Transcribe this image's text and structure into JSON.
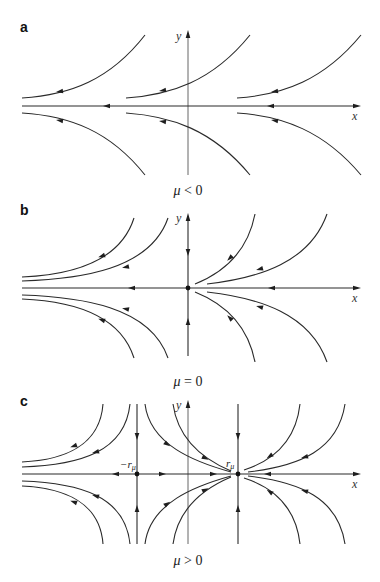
{
  "figure": {
    "panels": [
      {
        "id": "a",
        "label": "a",
        "caption_mu": "μ",
        "caption_rest": " < 0",
        "x_axis_label": "x",
        "y_axis_label": "y",
        "description": "No fixed points; all trajectories flow leftward"
      },
      {
        "id": "b",
        "label": "b",
        "caption_mu": "μ",
        "caption_rest": " = 0",
        "x_axis_label": "x",
        "y_axis_label": "y",
        "description": "Single half-stable fixed point at origin"
      },
      {
        "id": "c",
        "label": "c",
        "caption_mu": "μ",
        "caption_rest": " > 0",
        "x_axis_label": "x",
        "y_axis_label": "y",
        "neg_point_label": "−r",
        "neg_point_sub": "μ",
        "pos_point_label": "r",
        "pos_point_sub": "μ",
        "description": "Saddle at −rμ and stable node at rμ"
      }
    ],
    "colors": {
      "stroke": "#2a2a2a",
      "background": "#ffffff"
    }
  }
}
